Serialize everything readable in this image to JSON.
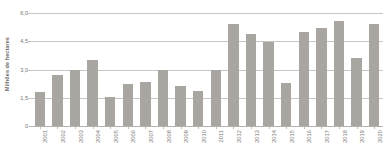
{
  "chart_data": {
    "type": "bar",
    "title": "",
    "subtitle": "",
    "xlabel": "",
    "ylabel": "Milhões de hectares",
    "categories": [
      "2001",
      "2002",
      "2003",
      "2004",
      "2005",
      "2006",
      "2007",
      "2008",
      "2009",
      "2010",
      "2011",
      "2012",
      "2013",
      "2014",
      "2015",
      "2016",
      "2017",
      "2018",
      "2019",
      "2020"
    ],
    "values": [
      1.8,
      2.7,
      3.0,
      3.5,
      1.55,
      2.25,
      2.35,
      3.0,
      2.1,
      1.85,
      3.0,
      5.4,
      4.9,
      4.45,
      2.3,
      5.0,
      5.2,
      5.55,
      3.6,
      5.4
    ],
    "ylim": [
      0,
      6.0
    ],
    "y_ticks": [
      0,
      1.5,
      3.0,
      4.5,
      6.0
    ],
    "y_tick_labels": [
      "0",
      "1,5",
      "3,0",
      "4,5",
      "6,0"
    ],
    "grid": true,
    "legend": null,
    "legend_position": "none",
    "bar_color": "#a9a6a2",
    "gridline_color": "#c9c7c4",
    "axis_text_color": "#77746f",
    "background_color": "#ffffff",
    "decimal_separator": ","
  }
}
